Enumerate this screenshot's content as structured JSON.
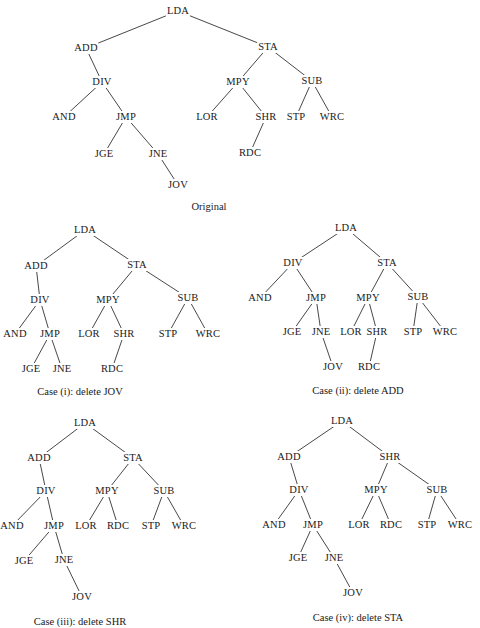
{
  "figure": {
    "trees": [
      {
        "id": "original",
        "caption": "Original",
        "caption_pos": [
          209,
          206
        ],
        "nodes": {
          "LDA": [
            178,
            11
          ],
          "ADD": [
            86,
            48
          ],
          "STA": [
            268,
            47
          ],
          "DIV": [
            102,
            82
          ],
          "MPY": [
            238,
            82
          ],
          "SUB": [
            312,
            81
          ],
          "AND": [
            64,
            117
          ],
          "JMP": [
            126,
            117
          ],
          "LOR": [
            207,
            117
          ],
          "SHR": [
            266,
            117
          ],
          "STP": [
            296,
            117
          ],
          "WRC": [
            332,
            117
          ],
          "JGE": [
            104,
            154
          ],
          "JNE": [
            158,
            154
          ],
          "RDC": [
            250,
            153
          ],
          "JOV": [
            178,
            185
          ]
        },
        "edges": [
          [
            "LDA",
            "ADD"
          ],
          [
            "LDA",
            "STA"
          ],
          [
            "ADD",
            "DIV"
          ],
          [
            "DIV",
            "AND"
          ],
          [
            "DIV",
            "JMP"
          ],
          [
            "JMP",
            "JGE"
          ],
          [
            "JMP",
            "JNE"
          ],
          [
            "JNE",
            "JOV"
          ],
          [
            "STA",
            "MPY"
          ],
          [
            "STA",
            "SUB"
          ],
          [
            "MPY",
            "LOR"
          ],
          [
            "MPY",
            "SHR"
          ],
          [
            "SHR",
            "RDC"
          ],
          [
            "SUB",
            "STP"
          ],
          [
            "SUB",
            "WRC"
          ]
        ]
      },
      {
        "id": "case-i",
        "caption": "Case (i): delete JOV",
        "caption_pos": [
          80,
          391
        ],
        "nodes": {
          "LDA": [
            85,
            230
          ],
          "ADD": [
            36,
            266
          ],
          "STA": [
            137,
            265
          ],
          "DIV": [
            40,
            300
          ],
          "MPY": [
            108,
            300
          ],
          "SUB": [
            188,
            298
          ],
          "AND": [
            15,
            334
          ],
          "JMP": [
            50,
            334
          ],
          "LOR": [
            89,
            334
          ],
          "SHR": [
            124,
            334
          ],
          "STP": [
            168,
            334
          ],
          "WRC": [
            208,
            334
          ],
          "JGE": [
            31,
            369
          ],
          "JNE": [
            62,
            369
          ],
          "RDC": [
            112,
            369
          ]
        },
        "edges": [
          [
            "LDA",
            "ADD"
          ],
          [
            "LDA",
            "STA"
          ],
          [
            "ADD",
            "DIV"
          ],
          [
            "DIV",
            "AND"
          ],
          [
            "DIV",
            "JMP"
          ],
          [
            "JMP",
            "JGE"
          ],
          [
            "JMP",
            "JNE"
          ],
          [
            "STA",
            "MPY"
          ],
          [
            "STA",
            "SUB"
          ],
          [
            "MPY",
            "LOR"
          ],
          [
            "MPY",
            "SHR"
          ],
          [
            "SHR",
            "RDC"
          ],
          [
            "SUB",
            "STP"
          ],
          [
            "SUB",
            "WRC"
          ]
        ]
      },
      {
        "id": "case-ii",
        "caption": "Case (ii): delete ADD",
        "caption_pos": [
          358,
          390
        ],
        "nodes": {
          "LDA": [
            346,
            228
          ],
          "DIV": [
            293,
            263
          ],
          "STA": [
            387,
            263
          ],
          "AND": [
            260,
            298
          ],
          "JMP": [
            316,
            298
          ],
          "MPY": [
            368,
            298
          ],
          "SUB": [
            418,
            297
          ],
          "JGE": [
            292,
            332
          ],
          "JNE": [
            321,
            332
          ],
          "LOR": [
            351,
            332
          ],
          "SHR": [
            377,
            332
          ],
          "STP": [
            413,
            332
          ],
          "WRC": [
            445,
            332
          ],
          "JOV": [
            333,
            367
          ],
          "RDC": [
            369,
            367
          ]
        },
        "edges": [
          [
            "LDA",
            "DIV"
          ],
          [
            "LDA",
            "STA"
          ],
          [
            "DIV",
            "AND"
          ],
          [
            "DIV",
            "JMP"
          ],
          [
            "JMP",
            "JGE"
          ],
          [
            "JMP",
            "JNE"
          ],
          [
            "JNE",
            "JOV"
          ],
          [
            "STA",
            "MPY"
          ],
          [
            "STA",
            "SUB"
          ],
          [
            "MPY",
            "LOR"
          ],
          [
            "MPY",
            "SHR"
          ],
          [
            "SHR",
            "RDC"
          ],
          [
            "SUB",
            "STP"
          ],
          [
            "SUB",
            "WRC"
          ]
        ]
      },
      {
        "id": "case-iii",
        "caption": "Case (iii): delete SHR",
        "caption_pos": [
          80,
          621
        ],
        "nodes": {
          "LDA": [
            85,
            423
          ],
          "ADD": [
            39,
            458
          ],
          "STA": [
            133,
            458
          ],
          "DIV": [
            46,
            491
          ],
          "MPY": [
            107,
            491
          ],
          "SUB": [
            164,
            491
          ],
          "AND": [
            12,
            526
          ],
          "JMP": [
            54,
            526
          ],
          "LOR": [
            86,
            526
          ],
          "RDC": [
            118,
            526
          ],
          "STP": [
            151,
            526
          ],
          "WRC": [
            184,
            526
          ],
          "JGE": [
            24,
            561
          ],
          "JNE": [
            64,
            560
          ],
          "JOV": [
            82,
            597
          ]
        },
        "edges": [
          [
            "LDA",
            "ADD"
          ],
          [
            "LDA",
            "STA"
          ],
          [
            "ADD",
            "DIV"
          ],
          [
            "DIV",
            "AND"
          ],
          [
            "DIV",
            "JMP"
          ],
          [
            "JMP",
            "JGE"
          ],
          [
            "JMP",
            "JNE"
          ],
          [
            "JNE",
            "JOV"
          ],
          [
            "STA",
            "MPY"
          ],
          [
            "STA",
            "SUB"
          ],
          [
            "MPY",
            "LOR"
          ],
          [
            "MPY",
            "RDC"
          ],
          [
            "SUB",
            "STP"
          ],
          [
            "SUB",
            "WRC"
          ]
        ]
      },
      {
        "id": "case-iv",
        "caption": "Case (iv): delete STA",
        "caption_pos": [
          358,
          617
        ],
        "nodes": {
          "LDA": [
            342,
            421
          ],
          "ADD": [
            289,
            457
          ],
          "SHR": [
            390,
            457
          ],
          "DIV": [
            299,
            490
          ],
          "MPY": [
            376,
            490
          ],
          "SUB": [
            437,
            490
          ],
          "AND": [
            274,
            525
          ],
          "JMP": [
            313,
            525
          ],
          "LOR": [
            359,
            525
          ],
          "RDC": [
            391,
            525
          ],
          "STP": [
            427,
            525
          ],
          "WRC": [
            460,
            525
          ],
          "JGE": [
            298,
            558
          ],
          "JNE": [
            334,
            558
          ],
          "JOV": [
            353,
            593
          ]
        },
        "edges": [
          [
            "LDA",
            "ADD"
          ],
          [
            "LDA",
            "SHR"
          ],
          [
            "ADD",
            "DIV"
          ],
          [
            "DIV",
            "AND"
          ],
          [
            "DIV",
            "JMP"
          ],
          [
            "JMP",
            "JGE"
          ],
          [
            "JMP",
            "JNE"
          ],
          [
            "JNE",
            "JOV"
          ],
          [
            "SHR",
            "MPY"
          ],
          [
            "SHR",
            "SUB"
          ],
          [
            "MPY",
            "LOR"
          ],
          [
            "MPY",
            "RDC"
          ],
          [
            "SUB",
            "STP"
          ],
          [
            "SUB",
            "WRC"
          ]
        ]
      }
    ]
  },
  "colors": {
    "background": "#ffffff",
    "ink": "#1a1a1a",
    "edge": "#333333"
  }
}
